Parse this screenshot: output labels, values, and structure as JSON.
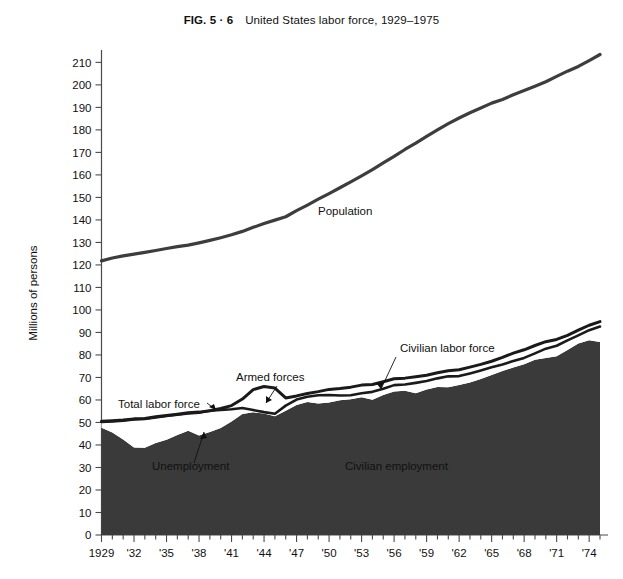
{
  "figure": {
    "number_label": "FIG. 5 · 6",
    "title": "United States labor force, 1929–1975",
    "ylabel": "Millions of persons"
  },
  "annotations": {
    "population": "Population",
    "civilian_labor_force": "Civilian labor force",
    "armed_forces": "Armed forces",
    "total_labor_force": "Total labor force",
    "unemployment": "Unemployment",
    "civilian_employment": "Civilian employment"
  },
  "colors": {
    "fill_employment": "#3a3a3a",
    "line_dark": "#1a1a1a",
    "axis": "#4a4a4a",
    "background": "#ffffff"
  },
  "chart_data": {
    "type": "area",
    "title": "United States labor force, 1929–1975",
    "xlabel": "",
    "ylabel": "Millions of persons",
    "xlim": [
      1929,
      1975
    ],
    "ylim": [
      0,
      215
    ],
    "ytick_step": 10,
    "grid": false,
    "legend": "annotated-inline",
    "xtick_labels": [
      "1929",
      "'32",
      "'35",
      "'38",
      "'41",
      "'44",
      "'47",
      "'50",
      "'53",
      "'56",
      "'59",
      "'62",
      "'65",
      "'68",
      "'71",
      "'74"
    ],
    "xtick_values": [
      1929,
      1932,
      1935,
      1938,
      1941,
      1944,
      1947,
      1950,
      1953,
      1956,
      1959,
      1962,
      1965,
      1968,
      1971,
      1974
    ],
    "ytick_labels": [
      "0",
      "10",
      "20",
      "30",
      "40",
      "50",
      "60",
      "70",
      "80",
      "90",
      "100",
      "110",
      "120",
      "130",
      "140",
      "150",
      "160",
      "170",
      "180",
      "190",
      "200",
      "210"
    ],
    "ytick_values": [
      0,
      10,
      20,
      30,
      40,
      50,
      60,
      70,
      80,
      90,
      100,
      110,
      120,
      130,
      140,
      150,
      160,
      170,
      180,
      190,
      200,
      210
    ],
    "minor_xticks_per_interval": 3,
    "x": [
      1929,
      1930,
      1931,
      1932,
      1933,
      1934,
      1935,
      1936,
      1937,
      1938,
      1939,
      1940,
      1941,
      1942,
      1943,
      1944,
      1945,
      1946,
      1947,
      1948,
      1949,
      1950,
      1951,
      1952,
      1953,
      1954,
      1955,
      1956,
      1957,
      1958,
      1959,
      1960,
      1961,
      1962,
      1963,
      1964,
      1965,
      1966,
      1967,
      1968,
      1969,
      1970,
      1971,
      1972,
      1973,
      1974,
      1975
    ],
    "series": [
      {
        "name": "Population",
        "units": "millions of persons",
        "values": [
          121.8,
          123.1,
          124.0,
          124.8,
          125.6,
          126.4,
          127.3,
          128.1,
          128.8,
          129.8,
          130.9,
          132.1,
          133.4,
          134.9,
          136.7,
          138.4,
          139.9,
          141.4,
          144.1,
          146.6,
          149.2,
          151.7,
          154.3,
          156.9,
          159.6,
          162.4,
          165.3,
          168.2,
          171.3,
          174.1,
          177.1,
          180.0,
          182.8,
          185.3,
          187.6,
          189.7,
          191.9,
          193.5,
          195.6,
          197.5,
          199.4,
          201.4,
          203.8,
          206.1,
          208.2,
          210.8,
          213.5
        ]
      },
      {
        "name": "Total labor force",
        "units": "millions of persons",
        "values": [
          50.5,
          50.8,
          51.1,
          51.6,
          51.8,
          52.5,
          53.1,
          53.7,
          54.3,
          54.6,
          55.2,
          56.2,
          57.5,
          60.4,
          64.6,
          66.0,
          65.3,
          60.9,
          61.8,
          62.9,
          63.7,
          64.7,
          65.1,
          65.7,
          66.6,
          66.9,
          68.1,
          69.4,
          69.7,
          70.3,
          71.0,
          72.1,
          73.0,
          73.4,
          74.6,
          75.8,
          77.2,
          78.9,
          80.8,
          82.3,
          84.2,
          85.9,
          86.9,
          88.7,
          91.0,
          93.2,
          94.8
        ]
      },
      {
        "name": "Civilian labor force",
        "units": "millions of persons",
        "values": [
          50.2,
          50.5,
          50.8,
          51.3,
          51.6,
          52.2,
          52.9,
          53.4,
          54.0,
          54.3,
          55.2,
          55.6,
          55.9,
          56.4,
          55.5,
          54.6,
          53.9,
          57.5,
          60.2,
          61.4,
          62.1,
          62.2,
          62.0,
          62.1,
          63.0,
          63.6,
          65.0,
          66.6,
          66.9,
          67.6,
          68.4,
          69.6,
          70.5,
          70.6,
          71.8,
          73.1,
          74.5,
          75.8,
          77.3,
          78.7,
          80.7,
          82.8,
          84.1,
          86.5,
          88.7,
          91.0,
          92.6
        ]
      },
      {
        "name": "Civilian employment",
        "units": "millions of persons",
        "values": [
          47.6,
          45.5,
          42.4,
          38.9,
          38.8,
          40.9,
          42.3,
          44.4,
          46.3,
          44.2,
          45.8,
          47.5,
          50.4,
          53.8,
          54.5,
          54.0,
          52.8,
          55.2,
          57.8,
          59.1,
          58.4,
          58.9,
          59.9,
          60.3,
          61.2,
          60.1,
          62.2,
          63.8,
          64.1,
          63.0,
          64.6,
          65.8,
          65.7,
          66.7,
          67.8,
          69.3,
          71.1,
          72.9,
          74.4,
          75.9,
          77.9,
          78.7,
          79.4,
          82.2,
          85.1,
          86.5,
          85.8
        ]
      }
    ],
    "annotation_notes": [
      {
        "label": "Population",
        "approx_year": 1950,
        "approx_value": 152
      },
      {
        "label": "Civilian labor force",
        "approx_year": 1956,
        "approx_value": 78
      },
      {
        "label": "Armed forces",
        "approx_year": 1943,
        "approx_value": 76
      },
      {
        "label": "Total labor force",
        "approx_year": 1935,
        "approx_value": 60
      },
      {
        "label": "Unemployment",
        "approx_year": 1936,
        "approx_value": 33
      },
      {
        "label": "Civilian employment",
        "approx_year": 1955,
        "approx_value": 33
      }
    ]
  }
}
